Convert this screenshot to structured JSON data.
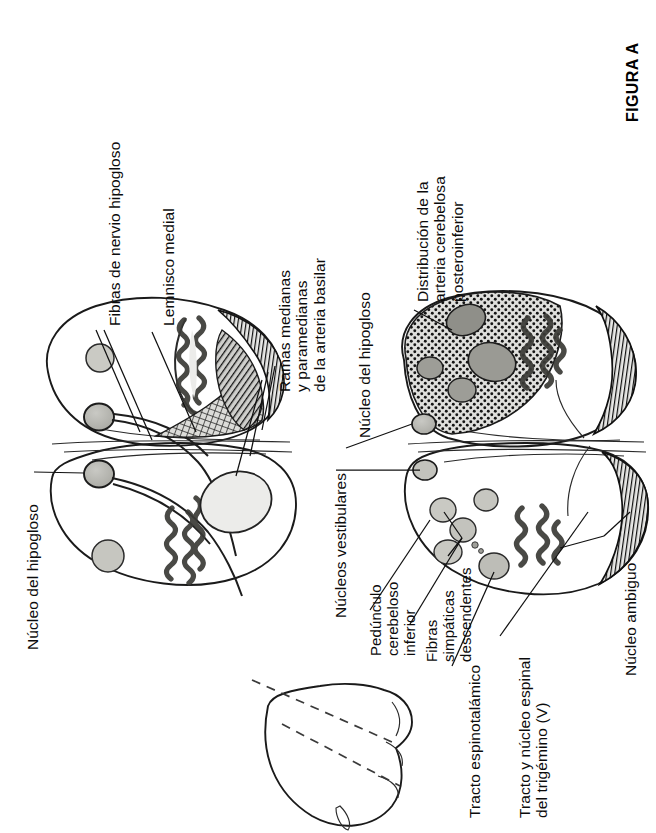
{
  "figure": {
    "tag": "FIGURA A",
    "background_color": "#ffffff",
    "ink_color": "#0b0b0b"
  },
  "labels": {
    "fibras_hipogloso": "Fibras de nervio hipogloso",
    "lemnisco_medial": "Lemnisco medial",
    "ramas_basilar": "Ramas medianas\ny paramedianas\nde la arteria basilar",
    "nucleo_hipogloso_sup": "Núcleo del hipogloso",
    "distribucion_pica": "Distribución de la\narteria cerebelosa\nposteroinferior",
    "nucleo_hipogloso_izq": "Núcleo del hipogloso",
    "nucleos_vestibulares": "Núcleos vestibulares",
    "pedunculo_cerebeloso": "Pedúnculo\ncerebeloso\ninferior",
    "fibras_simpaticas": "Fibras\nsimpáticas\ndescendentes",
    "tracto_espinotalamico": "Tracto espinotalámico",
    "tracto_trigemino": "Tracto y núcleo espinal\ndel trigémino (V)",
    "nucleo_ambiguo": "Núcleo ambiguo"
  },
  "anatomy": {
    "sections": [
      {
        "name": "upper-medulla-section",
        "description": "Sección superior de la médula oblongada",
        "structures": [
          "núcleo del hipogloso",
          "fibras de nervio hipogloso",
          "lemnisco medial",
          "oliva inferior",
          "pirámide",
          "tracto espinotalámico"
        ],
        "shading": [
          "hatched-pyramid",
          "crosshatch-lemniscus",
          "stipple-none"
        ]
      },
      {
        "name": "lower-medulla-section",
        "description": "Sección inferior con infarto lateral",
        "structures": [
          "núcleos vestibulares",
          "pedúnculo cerebeloso inferior",
          "fibras simpáticas descendentes",
          "tracto espinotalámico",
          "tracto y núcleo espinal del trigémino (V)",
          "núcleo ambiguo",
          "oliva inferior"
        ],
        "shading": [
          "stipple-infarct",
          "hatched-pyramid"
        ]
      },
      {
        "name": "brainstem-inset",
        "description": "Silueta del tronco encefálico con niveles de corte",
        "structures": [
          "tronco encefálico",
          "líneas de sección discontinuas"
        ]
      }
    ],
    "tissue_fill": "#e4e4e2",
    "nucleus_fill": "#b9b9b5",
    "infarct_fill": "#d8d8d5",
    "pyramid_fill": "#2c2c2c"
  }
}
